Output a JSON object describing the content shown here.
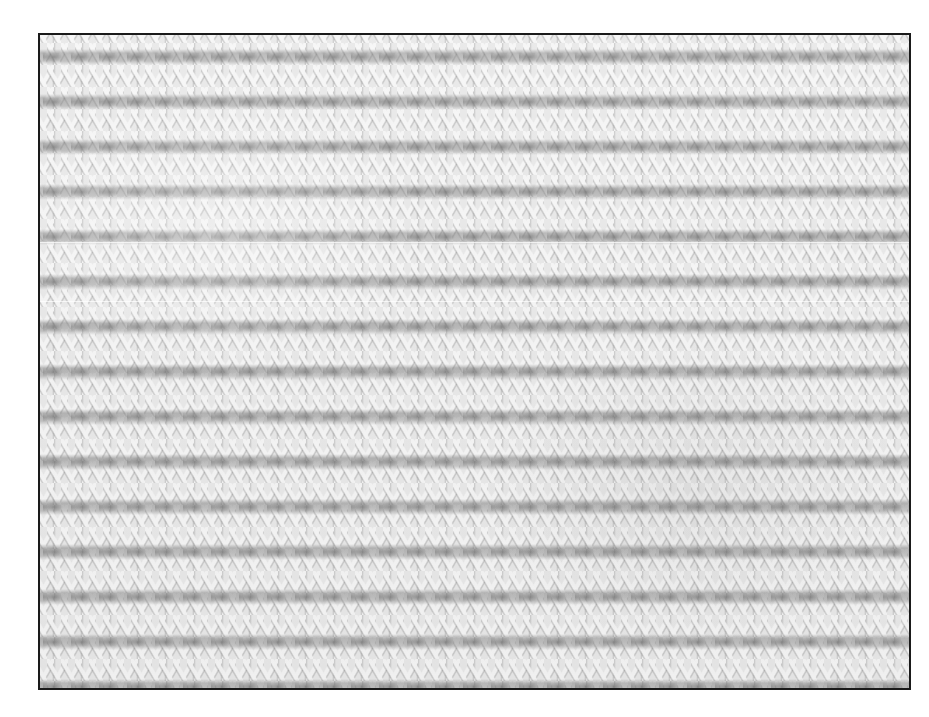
{
  "image": {
    "subject": "knitted fabric texture",
    "description": "Close-up photograph of white/cream knitted fabric in a textured knit-and-purl stitch, with alternating rows of V-shaped knit stitches and horizontal purl bumps, framed by a thin black border on a white background",
    "colors": {
      "background": "#ffffff",
      "frame_border": "#1a1a1a",
      "yarn_light": "#f4f4f4",
      "yarn_shadow": "#8c8c8c"
    },
    "frame": {
      "x": 38,
      "y": 33,
      "width": 871,
      "height": 655
    }
  }
}
